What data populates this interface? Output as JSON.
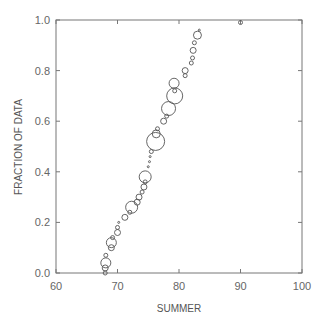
{
  "chart_data": {
    "type": "scatter",
    "title": "",
    "xlabel": "SUMMER",
    "ylabel": "FRACTION OF DATA",
    "xlim": [
      60,
      100
    ],
    "ylim": [
      0.0,
      1.0
    ],
    "xticks": [
      "60",
      "70",
      "80",
      "90",
      "100"
    ],
    "yticks": [
      "0.0",
      "0.2",
      "0.4",
      "0.6",
      "0.8",
      "1.0"
    ],
    "grid": false,
    "legend": null,
    "points": [
      {
        "x": 68.0,
        "y": 0.0,
        "r": 2
      },
      {
        "x": 68.0,
        "y": 0.02,
        "r": 3
      },
      {
        "x": 68.1,
        "y": 0.04,
        "r": 5
      },
      {
        "x": 68.1,
        "y": 0.07,
        "r": 2
      },
      {
        "x": 69.0,
        "y": 0.1,
        "r": 3
      },
      {
        "x": 69.0,
        "y": 0.12,
        "r": 5
      },
      {
        "x": 69.2,
        "y": 0.14,
        "r": 2
      },
      {
        "x": 70.0,
        "y": 0.16,
        "r": 3
      },
      {
        "x": 70.0,
        "y": 0.18,
        "r": 2
      },
      {
        "x": 70.2,
        "y": 0.2,
        "r": 1
      },
      {
        "x": 71.2,
        "y": 0.22,
        "r": 3
      },
      {
        "x": 72.0,
        "y": 0.24,
        "r": 2
      },
      {
        "x": 72.3,
        "y": 0.26,
        "r": 6
      },
      {
        "x": 73.2,
        "y": 0.28,
        "r": 3
      },
      {
        "x": 73.5,
        "y": 0.3,
        "r": 3
      },
      {
        "x": 74.0,
        "y": 0.32,
        "r": 2
      },
      {
        "x": 74.3,
        "y": 0.34,
        "r": 3
      },
      {
        "x": 74.5,
        "y": 0.36,
        "r": 2
      },
      {
        "x": 74.5,
        "y": 0.38,
        "r": 6
      },
      {
        "x": 75.0,
        "y": 0.42,
        "r": 1
      },
      {
        "x": 75.2,
        "y": 0.44,
        "r": 1
      },
      {
        "x": 75.3,
        "y": 0.46,
        "r": 1
      },
      {
        "x": 75.5,
        "y": 0.48,
        "r": 2
      },
      {
        "x": 76.2,
        "y": 0.52,
        "r": 9
      },
      {
        "x": 76.3,
        "y": 0.55,
        "r": 4
      },
      {
        "x": 76.5,
        "y": 0.57,
        "r": 2
      },
      {
        "x": 77.5,
        "y": 0.6,
        "r": 3
      },
      {
        "x": 78.0,
        "y": 0.62,
        "r": 2
      },
      {
        "x": 78.3,
        "y": 0.65,
        "r": 7
      },
      {
        "x": 79.3,
        "y": 0.7,
        "r": 8
      },
      {
        "x": 79.3,
        "y": 0.72,
        "r": 2
      },
      {
        "x": 79.2,
        "y": 0.75,
        "r": 5
      },
      {
        "x": 81.0,
        "y": 0.78,
        "r": 2
      },
      {
        "x": 81.0,
        "y": 0.8,
        "r": 3
      },
      {
        "x": 82.0,
        "y": 0.83,
        "r": 2
      },
      {
        "x": 82.2,
        "y": 0.85,
        "r": 2
      },
      {
        "x": 82.3,
        "y": 0.88,
        "r": 3
      },
      {
        "x": 82.5,
        "y": 0.91,
        "r": 2
      },
      {
        "x": 83.0,
        "y": 0.94,
        "r": 4
      },
      {
        "x": 83.3,
        "y": 0.96,
        "r": 1
      },
      {
        "x": 90.0,
        "y": 0.99,
        "r": 2
      }
    ]
  }
}
